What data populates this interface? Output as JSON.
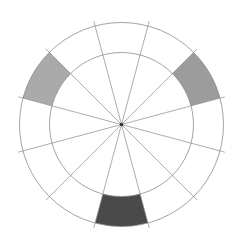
{
  "diagram": {
    "type": "color-wheel",
    "title": "",
    "center": [
      121.5,
      124.5
    ],
    "outer_radius": 102,
    "inner_radius": 72,
    "spoke_extend_radius": 107,
    "segment_count": 12,
    "spoke_offset_deg": 15,
    "line_color": "#8a8a8a",
    "background": "#ffffff",
    "center_dot_color": "#333333",
    "shaded_segments": [
      {
        "name": "upper-left",
        "start_deg": 135,
        "end_deg": 165,
        "color": "#aaaaaa"
      },
      {
        "name": "upper-right",
        "start_deg": 15,
        "end_deg": 45,
        "color": "#9c9c9c"
      },
      {
        "name": "bottom",
        "start_deg": 255,
        "end_deg": 285,
        "color": "#4a4a4a"
      }
    ]
  }
}
